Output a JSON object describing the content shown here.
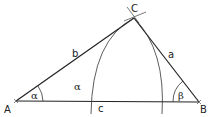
{
  "faint_header": "",
  "colors": {
    "stroke": "#222222",
    "background": "#ffffff"
  },
  "vertices": {
    "A": {
      "label": "A",
      "x": 16,
      "y": 101
    },
    "B": {
      "label": "B",
      "x": 199,
      "y": 102
    },
    "C": {
      "label": "C",
      "x": 134,
      "y": 18
    }
  },
  "sides": {
    "a": {
      "label": "a",
      "between": [
        "B",
        "C"
      ]
    },
    "b": {
      "label": "b",
      "between": [
        "A",
        "C"
      ]
    },
    "c": {
      "label": "c",
      "between": [
        "A",
        "B"
      ]
    }
  },
  "angles": {
    "alpha": {
      "label": "α",
      "at": "A"
    },
    "alpha_copy": {
      "label": "α",
      "region": "between arc and side b"
    },
    "beta": {
      "label": "β",
      "at": "B"
    }
  },
  "construction_arcs": [
    {
      "name": "left-arc",
      "from": [
        91,
        114
      ],
      "to": [
        134,
        18
      ]
    },
    {
      "name": "right-arc",
      "from": [
        162,
        114
      ],
      "to": [
        134,
        18
      ]
    }
  ]
}
